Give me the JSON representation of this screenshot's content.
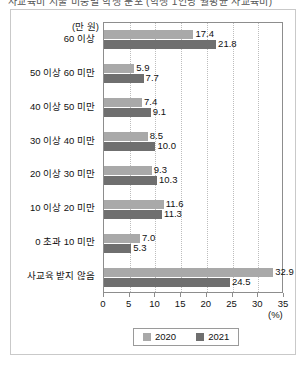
{
  "title": {
    "text": "사교육비 지출 비중별 학생 분포 (학생 1인당 월평균 사교육비)",
    "cropped": true
  },
  "chart_data": {
    "type": "bar",
    "orientation": "horizontal",
    "title": "",
    "xlabel": "(%)",
    "ylabel": "(만 원)",
    "xlim": [
      0,
      35
    ],
    "xticks": [
      0,
      5,
      10,
      15,
      20,
      25,
      30,
      35
    ],
    "grid": "vertical-dotted",
    "legend_position": "bottom-center",
    "categories": [
      "60 이상",
      "50 이상 60 미만",
      "40 이상 50 미만",
      "30 이상 40 미만",
      "20 이상 30 미만",
      "10 이상 20 미만",
      "0 초과 10 미만",
      "사교육 받지 않음"
    ],
    "series": [
      {
        "name": "2020",
        "color": "#a9a9a9",
        "values": [
          17.4,
          5.9,
          7.4,
          8.5,
          9.3,
          11.6,
          7.0,
          32.9
        ]
      },
      {
        "name": "2021",
        "color": "#6f6f6f",
        "values": [
          21.8,
          7.7,
          9.1,
          10.0,
          10.3,
          11.3,
          5.3,
          24.5
        ]
      }
    ]
  },
  "legend": {
    "items": [
      {
        "label": "2020",
        "color": "#a9a9a9"
      },
      {
        "label": "2021",
        "color": "#6f6f6f"
      }
    ]
  },
  "axis": {
    "y_unit": "(만 원)",
    "x_unit": "(%)"
  }
}
